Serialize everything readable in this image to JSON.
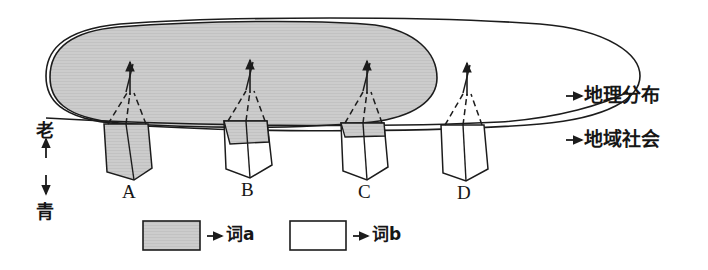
{
  "figure": {
    "title": "",
    "axis_left": {
      "top_label": "老",
      "bottom_label": "青",
      "up_arrow": "↑",
      "down_arrow": "↓"
    },
    "right_labels": [
      {
        "arrow": "→",
        "text": "地理分布"
      },
      {
        "arrow": "→",
        "text": "地域社会"
      }
    ],
    "cones": [
      {
        "id": "A",
        "label": "A",
        "fill": "shaded"
      },
      {
        "id": "B",
        "label": "B",
        "fill": "partial"
      },
      {
        "id": "C",
        "label": "C",
        "fill": "white"
      },
      {
        "id": "D",
        "label": "D",
        "fill": "white"
      }
    ],
    "legend": [
      {
        "swatch": "shaded",
        "arrow": "→",
        "text": "词a"
      },
      {
        "swatch": "white",
        "arrow": "→",
        "text": "词b"
      }
    ],
    "colors": {
      "shaded": "#c9c9c9",
      "stroke": "#1c1c1c",
      "background": "#ffffff"
    }
  }
}
